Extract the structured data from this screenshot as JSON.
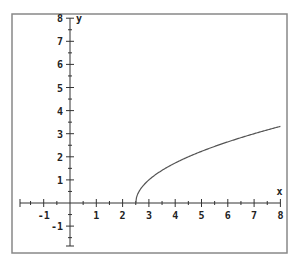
{
  "chart_data": {
    "type": "line",
    "title": "",
    "xlabel": "x",
    "ylabel": "y",
    "xlim": [
      -2,
      8
    ],
    "ylim": [
      -2,
      8
    ],
    "x_ticks": [
      -1,
      1,
      2,
      3,
      4,
      5,
      6,
      7,
      8
    ],
    "y_ticks": [
      -1,
      1,
      2,
      3,
      4,
      5,
      6,
      7,
      8
    ],
    "minor_ticks_per_unit": 2,
    "grid": false,
    "series": [
      {
        "name": "y = sqrt(2x - 5)",
        "function": "sqrt(2*x-5)",
        "x": [
          2.5,
          2.6,
          2.75,
          3,
          3.5,
          4,
          4.5,
          5,
          5.5,
          6,
          6.5,
          7,
          7.5,
          8
        ],
        "values": [
          0,
          0.45,
          0.71,
          1,
          1.41,
          1.73,
          2,
          2.24,
          2.45,
          2.65,
          2.83,
          3,
          3.16,
          3.32
        ]
      }
    ],
    "colors": {
      "frame": "#888888",
      "axis": "#333333",
      "curve": "#555555"
    }
  }
}
